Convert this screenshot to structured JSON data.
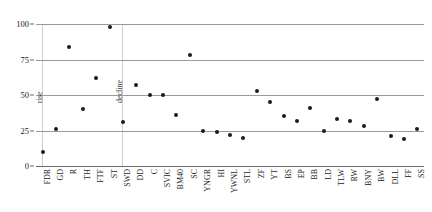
{
  "chart_data": {
    "type": "scatter",
    "title": "",
    "subtitle": "",
    "xlabel": "",
    "ylabel": "",
    "ylim": [
      0,
      100
    ],
    "yticks": [
      0,
      25,
      50,
      75,
      100
    ],
    "grid": "horizontal",
    "legend": "none",
    "categories": [
      "FDR",
      "GD",
      "R",
      "TH",
      "FTF",
      "ST",
      "SWD",
      "DD",
      "C",
      "SVIC",
      "BM40",
      "SC",
      "YNGR",
      "HI",
      "YWNL",
      "STL",
      "ZF",
      "YT",
      "BS",
      "EP",
      "BB",
      "LD",
      "TLW",
      "RW",
      "BNY",
      "BW",
      "DLL",
      "FF",
      "SS"
    ],
    "values": [
      10,
      26,
      84,
      40,
      62,
      98,
      31,
      57,
      50,
      50,
      36,
      78,
      25,
      24,
      22,
      20,
      53,
      45,
      35,
      32,
      41,
      25,
      33,
      32,
      28,
      47,
      21,
      19,
      26
    ],
    "series": [
      {
        "name": "value",
        "points": [
          {
            "category": "FDR",
            "value": 10
          },
          {
            "category": "GD",
            "value": 26
          },
          {
            "category": "R",
            "value": 84
          },
          {
            "category": "TH",
            "value": 40
          },
          {
            "category": "FTF",
            "value": 62
          },
          {
            "category": "ST",
            "value": 98
          },
          {
            "category": "SWD",
            "value": 31
          },
          {
            "category": "DD",
            "value": 57
          },
          {
            "category": "C",
            "value": 50
          },
          {
            "category": "SVIC",
            "value": 50
          },
          {
            "category": "BM40",
            "value": 36
          },
          {
            "category": "SC",
            "value": 78
          },
          {
            "category": "YNGR",
            "value": 25
          },
          {
            "category": "HI",
            "value": 24
          },
          {
            "category": "YWNL",
            "value": 22
          },
          {
            "category": "STL",
            "value": 20
          },
          {
            "category": "ZF",
            "value": 53
          },
          {
            "category": "YT",
            "value": 45
          },
          {
            "category": "BS",
            "value": 35
          },
          {
            "category": "EP",
            "value": 32
          },
          {
            "category": "BB",
            "value": 41
          },
          {
            "category": "LD",
            "value": 25
          },
          {
            "category": "TLW",
            "value": 33
          },
          {
            "category": "RW",
            "value": 32
          },
          {
            "category": "BNY",
            "value": 28
          },
          {
            "category": "BW",
            "value": 47
          },
          {
            "category": "DLL",
            "value": 21
          },
          {
            "category": "FF",
            "value": 19
          },
          {
            "category": "SS",
            "value": 26
          }
        ]
      }
    ],
    "annotations": [
      {
        "text": "rise",
        "x_category": "FDR",
        "value": 50,
        "orientation": "vertical"
      },
      {
        "text": "decline",
        "x_category": "SWD",
        "value": 50,
        "orientation": "vertical"
      }
    ],
    "colors": {
      "marker": "#1b1b1b",
      "gridline": "#9a9a9a",
      "axis": "#6a6a6a",
      "text": "#1a1a1a",
      "background": "#ffffff"
    }
  }
}
